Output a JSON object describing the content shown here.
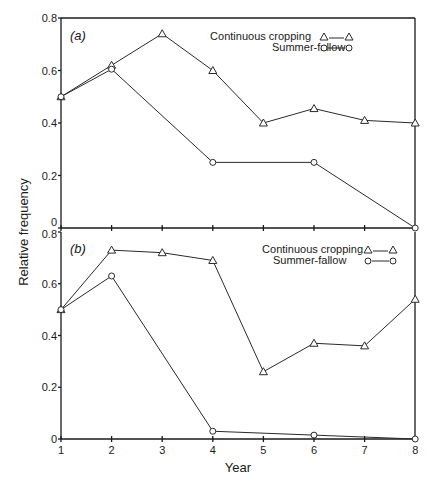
{
  "chart_data": [
    {
      "type": "line",
      "panel_label": "(a)",
      "x": [
        1,
        2,
        3,
        4,
        5,
        6,
        7,
        8
      ],
      "xlabel": "Year",
      "ylabel": "Relative frequency",
      "ylim": [
        0,
        0.8
      ],
      "yticks": [
        "0",
        "0.2",
        "0.4",
        "0.6",
        "0.8"
      ],
      "grid": false,
      "legend_position": "upper right",
      "series": [
        {
          "name": "Continuous cropping",
          "marker": "triangle",
          "x": [
            1,
            2,
            3,
            4,
            5,
            6,
            7,
            8
          ],
          "values": [
            0.5,
            0.62,
            0.74,
            0.6,
            0.4,
            0.455,
            0.41,
            0.4
          ]
        },
        {
          "name": "Summer-fallow",
          "marker": "circle",
          "x": [
            1,
            2,
            4,
            6,
            8
          ],
          "values": [
            0.5,
            0.605,
            0.25,
            0.25,
            0.0
          ]
        }
      ]
    },
    {
      "type": "line",
      "panel_label": "(b)",
      "x": [
        1,
        2,
        3,
        4,
        5,
        6,
        7,
        8
      ],
      "xlabel": "Year",
      "ylabel": "Relative frequency",
      "ylim": [
        0,
        0.8
      ],
      "xticks": [
        "1",
        "2",
        "3",
        "4",
        "5",
        "6",
        "7",
        "8"
      ],
      "yticks": [
        "0",
        "0.2",
        "0.4",
        "0.6",
        "0.8"
      ],
      "grid": false,
      "legend_position": "upper right",
      "series": [
        {
          "name": "Continuous cropping",
          "marker": "triangle",
          "x": [
            1,
            2,
            3,
            4,
            5,
            6,
            7,
            8
          ],
          "values": [
            0.5,
            0.73,
            0.72,
            0.69,
            0.26,
            0.37,
            0.36,
            0.54
          ]
        },
        {
          "name": "Summer-fallow",
          "marker": "circle",
          "x": [
            1,
            2,
            4,
            6,
            8
          ],
          "values": [
            0.5,
            0.63,
            0.03,
            0.015,
            0.0
          ]
        }
      ]
    }
  ],
  "labels": {
    "xlabel": "Year",
    "ylabel": "Relative frequency",
    "panel_a": "(a)",
    "panel_b": "(b)",
    "legend_cc": "Continuous cropping",
    "legend_sf": "Summer-fallow"
  }
}
